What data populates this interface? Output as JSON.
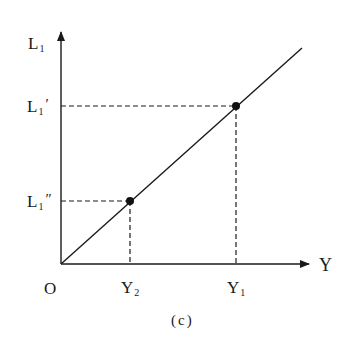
{
  "figure": {
    "caption": "(c)",
    "axes": {
      "y_axis_label_main": "L",
      "y_axis_label_sub": "1",
      "x_axis_label": "Y",
      "origin_label": "O"
    },
    "y_ticks": [
      {
        "main": "L",
        "sub": "1",
        "prime": "′",
        "name": "L1-prime"
      },
      {
        "main": "L",
        "sub": "1",
        "prime": "″",
        "name": "L1-double-prime"
      }
    ],
    "x_ticks": [
      {
        "main": "Y",
        "sub": "2",
        "name": "Y2"
      },
      {
        "main": "Y",
        "sub": "1",
        "name": "Y1"
      }
    ],
    "points": [
      {
        "label": "(Y1, L1′)",
        "x": 236,
        "y": 106
      },
      {
        "label": "(Y2, L1″)",
        "x": 130,
        "y": 201
      }
    ],
    "line": {
      "from": [
        61,
        264
      ],
      "to": [
        302,
        48
      ],
      "description": "upward-sloping line from origin"
    },
    "colors": {
      "stroke": "#1a1a1a",
      "background": "#ffffff"
    }
  }
}
